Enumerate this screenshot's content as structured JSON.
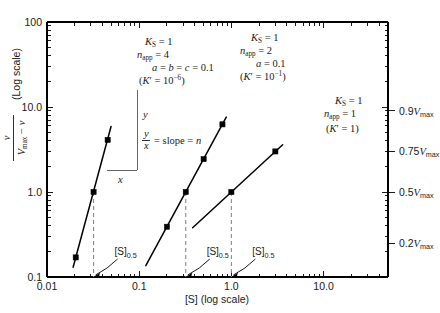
{
  "chart_data": {
    "type": "line",
    "title": "",
    "xlabel": "[S] (log scale)",
    "ylabel": "v / (Vmax − v)  (Log scale)",
    "ylabel_parts": {
      "numerator": "v",
      "denominator": "Vmax − v",
      "suffix": "(Log scale)"
    },
    "xlabel_parts": {
      "symbol": "[S]",
      "suffix": "(log scale)"
    },
    "xscale": "log",
    "yscale": "log",
    "xlim": [
      0.01,
      50
    ],
    "ylim": [
      0.1,
      100
    ],
    "xticklabels": [
      "0.01",
      "0.1",
      "1.0",
      "10.0"
    ],
    "xtickvalues": [
      0.01,
      0.1,
      1.0,
      10.0
    ],
    "yticklabels": [
      "0.1",
      "1.0",
      "10.0",
      "100"
    ],
    "ytickvalues": [
      0.1,
      1.0,
      10.0,
      100
    ],
    "grid": false,
    "legend": "none",
    "right_axis_labels": [
      {
        "text": "0.9",
        "vmax": "Vmax",
        "value": 9.0
      },
      {
        "text": "0.75",
        "vmax": "Vmax",
        "value": 3.0
      },
      {
        "text": "0.5",
        "vmax": "Vmax",
        "value": 1.0
      },
      {
        "text": "0.2",
        "vmax": "Vmax",
        "value": 0.25
      }
    ],
    "series": [
      {
        "name": "n_app = 4",
        "slope": 4,
        "s_half": 0.032,
        "x": [
          0.0205,
          0.0246,
          0.032,
          0.0455
        ],
        "y": [
          0.17,
          0.355,
          1.0,
          4.1
        ],
        "markers_x": [
          0.0205,
          0.032,
          0.0455
        ],
        "markers_y": [
          0.17,
          1.0,
          4.1
        ],
        "line_start": [
          0.0192,
          0.13
        ],
        "line_end": [
          0.0495,
          5.9
        ]
      },
      {
        "name": "n_app = 2",
        "slope": 2,
        "s_half": 0.32,
        "x": [
          0.125,
          0.2,
          0.32,
          0.5,
          0.8
        ],
        "y": [
          0.152,
          0.39,
          1.0,
          2.44,
          6.25
        ],
        "markers_x": [
          0.2,
          0.32,
          0.5,
          0.8
        ],
        "markers_y": [
          0.39,
          1.0,
          2.44,
          6.25
        ],
        "line_start": [
          0.118,
          0.136
        ],
        "line_end": [
          0.88,
          7.6
        ]
      },
      {
        "name": "n_app = 1",
        "slope": 1,
        "s_half": 1.0,
        "x": [
          0.4,
          1.0,
          3.0
        ],
        "y": [
          0.4,
          1.0,
          3.0
        ],
        "markers_x": [
          1.0,
          3.0
        ],
        "markers_y": [
          1.0,
          3.0
        ],
        "line_start": [
          0.38,
          0.38
        ],
        "line_end": [
          3.6,
          3.6
        ]
      }
    ],
    "annotations": [
      {
        "id": "block-1",
        "lines": [
          {
            "sym": "K",
            "sym_sub": "S",
            "rhs": "= 1"
          },
          {
            "sym": "n",
            "sym_sub": "app",
            "rhs": "= 4"
          },
          {
            "sym": "",
            "sym_sub": "",
            "rhs": "a = b = c = 0.1"
          },
          {
            "sym": "",
            "sym_sub": "",
            "rhs": "(K′ = 10⁻⁶)"
          }
        ],
        "text": "K_S = 1; n_app = 4; a = b = c = 0.1; (K' = 10^-6)"
      },
      {
        "id": "block-2",
        "lines": [
          {
            "sym": "K",
            "sym_sub": "S",
            "rhs": "= 1"
          },
          {
            "sym": "n",
            "sym_sub": "app",
            "rhs": "= 2"
          },
          {
            "sym": "",
            "sym_sub": "",
            "rhs": "a = 0.1"
          },
          {
            "sym": "",
            "sym_sub": "",
            "rhs": "(K′ = 10⁻¹)"
          }
        ],
        "text": "K_S = 1; n_app = 2; a = 0.1; (K' = 10^-1)"
      },
      {
        "id": "block-3",
        "lines": [
          {
            "sym": "K",
            "sym_sub": "S",
            "rhs": "= 1"
          },
          {
            "sym": "n",
            "sym_sub": "app",
            "rhs": "= 1"
          },
          {
            "sym": "",
            "sym_sub": "",
            "rhs": "(K′ = 1)"
          }
        ],
        "text": "K_S = 1; n_app = 1; (K' = 1)"
      }
    ],
    "slope_annotation": {
      "y_label": "y",
      "x_label": "x",
      "formula_num": "y",
      "formula_den": "x",
      "formula_rest": "= slope = n",
      "text": "y/x = slope = n"
    },
    "s_half_labels": [
      {
        "base": "[S]",
        "sub": "0.5",
        "at_x": 0.032
      },
      {
        "base": "[S]",
        "sub": "0.5",
        "at_x": 0.32
      },
      {
        "base": "[S]",
        "sub": "0.5",
        "at_x": 1.0
      }
    ],
    "colors": {
      "axis": "#000000",
      "curve": "#000000",
      "dashed": "#8a8a8a",
      "background": "#ffffff",
      "text": "#1a1a1a"
    }
  }
}
